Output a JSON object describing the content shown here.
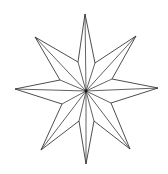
{
  "figure": {
    "stroke_color": "#3a3a3a",
    "background_color": "#ffffff",
    "center": [
      86,
      91
    ],
    "points": 8,
    "tips": [
      {
        "name": "top",
        "xy": [
          85,
          14
        ]
      },
      {
        "name": "top-right",
        "xy": [
          136,
          36
        ]
      },
      {
        "name": "right",
        "xy": [
          158,
          88
        ]
      },
      {
        "name": "bottom-right",
        "xy": [
          130,
          149
        ]
      },
      {
        "name": "bottom",
        "xy": [
          86,
          164
        ]
      },
      {
        "name": "bottom-left",
        "xy": [
          41,
          150
        ]
      },
      {
        "name": "left",
        "xy": [
          15,
          89
        ]
      },
      {
        "name": "top-left",
        "xy": [
          35,
          37
        ]
      }
    ],
    "inner_vertices": [
      [
        95,
        63
      ],
      [
        112,
        79
      ],
      [
        111,
        103
      ],
      [
        94,
        121
      ],
      [
        79,
        121
      ],
      [
        62,
        104
      ],
      [
        60,
        80
      ],
      [
        78,
        62
      ]
    ]
  }
}
